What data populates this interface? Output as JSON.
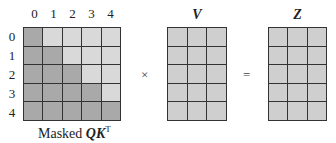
{
  "qk": {
    "col_labels": [
      "0",
      "1",
      "2",
      "3",
      "4"
    ],
    "row_labels": [
      "0",
      "1",
      "2",
      "3",
      "4"
    ],
    "caption_prefix": "Masked ",
    "caption_math": "QK",
    "caption_sup": "T"
  },
  "v": {
    "title": "V",
    "rows": 5,
    "cols": 3
  },
  "z": {
    "title": "Z",
    "rows": 5,
    "cols": 3
  },
  "operators": {
    "multiply": "×",
    "equals": "="
  },
  "colors": {
    "masked_cell": "#a9a9a9",
    "unmasked_cell": "#d9d9d9",
    "matrix_cell": "#cfcfcf",
    "grid_line": "#333333"
  }
}
